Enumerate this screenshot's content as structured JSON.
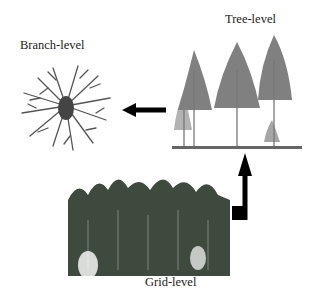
{
  "diagram": {
    "levels": [
      {
        "id": "branch",
        "label": "Branch-level"
      },
      {
        "id": "tree",
        "label": "Tree-level"
      },
      {
        "id": "grid",
        "label": "Grid-level"
      }
    ],
    "flow": [
      {
        "from": "Grid-level",
        "to": "Tree-level",
        "arrow": "up-bent"
      },
      {
        "from": "Tree-level",
        "to": "Branch-level",
        "arrow": "left"
      }
    ],
    "colors": {
      "arrow": "#000000",
      "vegetation": "#4a4a4a",
      "background": "#ffffff"
    }
  }
}
